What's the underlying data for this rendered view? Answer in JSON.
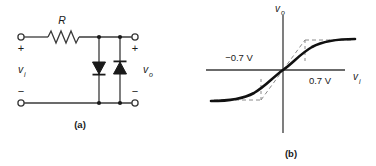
{
  "figure": {
    "panels": [
      {
        "id": "a",
        "caption": "(a)",
        "type": "circuit-schematic",
        "description": "Diode clipper circuit: series resistor R with two anti-parallel diodes shunting input to output",
        "components": {
          "resistor": {
            "label": "R",
            "orientation": "horizontal"
          },
          "diode_left": {
            "name": "diode-left",
            "orientation": "pointing-down"
          },
          "diode_right": {
            "name": "diode-right",
            "orientation": "pointing-up"
          }
        },
        "terminals": {
          "input_top_sign": "+",
          "input_bottom_sign": "−",
          "output_top_sign": "+",
          "output_bottom_sign": "−"
        },
        "labels": {
          "input_voltage": "v",
          "input_voltage_sub": "i",
          "output_voltage": "v",
          "output_voltage_sub": "o"
        }
      },
      {
        "id": "b",
        "caption": "(b)",
        "type": "transfer-characteristic",
        "description": "Voltage transfer characteristic: saturating S-shaped curve clipped near plus and minus 0.7 V",
        "axes": {
          "x_label": "v",
          "x_label_sub": "i",
          "y_label": "v",
          "y_label_sub": "o"
        },
        "annotations": [
          {
            "name": "negative-threshold",
            "text": "−0.7 V",
            "value": -0.7,
            "unit": "V"
          },
          {
            "name": "positive-threshold",
            "text": "0.7 V",
            "value": 0.7,
            "unit": "V"
          }
        ]
      }
    ]
  },
  "style": {
    "line_color": "#3a3a3a",
    "curve_color": "#111111",
    "dash_color": "#8a8a8a",
    "text_color": "#1a1a1a",
    "background": "#ffffff"
  }
}
